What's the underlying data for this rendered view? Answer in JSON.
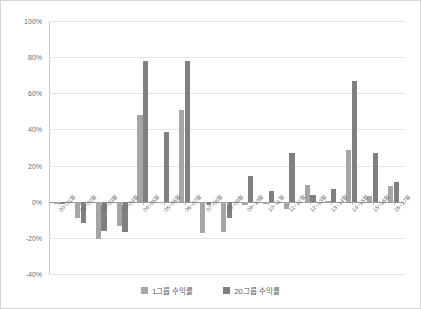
{
  "chart_data": {
    "type": "bar",
    "title": "",
    "subtitle": "",
    "xlabel": "",
    "ylabel": "",
    "ylim": [
      -40,
      100
    ],
    "grid": true,
    "legend_position": "bottom",
    "y_ticks": [
      "100%",
      "80%",
      "60%",
      "40%",
      "20%",
      "0%",
      "-20%",
      "-40%"
    ],
    "y_tick_values": [
      100,
      80,
      60,
      40,
      20,
      0,
      -20,
      -40
    ],
    "categories": [
      "00~01월",
      "01~02월",
      "02~03월",
      "03~04월",
      "04~05월",
      "05~06월",
      "06~07월",
      "07~08월",
      "08~09월",
      "09~10월",
      "10~11월",
      "11~12월",
      "12~13월",
      "13~14월",
      "14~15월",
      "15~16월",
      "16~17월"
    ],
    "series": [
      {
        "name": "1그룹 수익률",
        "color": "#a6a6a6",
        "values": [
          -1,
          -9,
          -20.5,
          -13.5,
          48,
          -0.5,
          50.5,
          -17.5,
          -16.5,
          -2,
          -1,
          -4,
          9,
          0,
          28.5,
          3,
          8.5
        ]
      },
      {
        "name": "20그룹 수익률",
        "color": "#808080",
        "values": [
          -1,
          -11.5,
          -16,
          -16.5,
          78,
          38.5,
          78,
          -2,
          -9,
          14.5,
          6,
          27,
          4,
          7,
          67,
          27,
          11
        ]
      }
    ]
  },
  "legend": {
    "items": [
      {
        "label": "1그룹 수익률",
        "color": "#a6a6a6"
      },
      {
        "label": "20그룹 수익률",
        "color": "#808080"
      }
    ]
  }
}
